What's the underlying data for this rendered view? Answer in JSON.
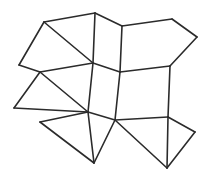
{
  "figure": {
    "type": "line-diagram",
    "background_color": "#ffffff",
    "line_color": "#2b2b2b",
    "line_width": 1.6,
    "canvas": {
      "width": 209,
      "height": 176
    }
  },
  "geometry": {
    "vertices": [
      {
        "id": "v0",
        "name": "top-left-apex",
        "x": 44,
        "y": 22
      },
      {
        "id": "v1",
        "name": "top-center-apex",
        "x": 95,
        "y": 13
      },
      {
        "id": "v2",
        "name": "top-upper-junction",
        "x": 122,
        "y": 26
      },
      {
        "id": "v3",
        "name": "top-right-apex",
        "x": 172,
        "y": 19
      },
      {
        "id": "v4",
        "name": "right-upper-corner",
        "x": 197,
        "y": 37
      },
      {
        "id": "v5",
        "name": "left-upper-corner",
        "x": 19,
        "y": 65
      },
      {
        "id": "v6",
        "name": "mid-left-junction",
        "x": 40,
        "y": 72
      },
      {
        "id": "v7",
        "name": "center-upper-junction",
        "x": 93,
        "y": 63
      },
      {
        "id": "v8",
        "name": "center-right-junction",
        "x": 120,
        "y": 72
      },
      {
        "id": "v9",
        "name": "right-mid-junction",
        "x": 170,
        "y": 66
      },
      {
        "id": "v10",
        "name": "left-mid-corner",
        "x": 14,
        "y": 108
      },
      {
        "id": "v11",
        "name": "center-lower-junction",
        "x": 88,
        "y": 112
      },
      {
        "id": "v12",
        "name": "lower-center-right-node",
        "x": 115,
        "y": 120
      },
      {
        "id": "v13",
        "name": "right-lower-junction",
        "x": 168,
        "y": 117
      },
      {
        "id": "v14",
        "name": "right-lower-corner",
        "x": 195,
        "y": 132
      },
      {
        "id": "v15",
        "name": "bottom-left-node",
        "x": 40,
        "y": 122
      },
      {
        "id": "v16",
        "name": "bottom-center-apex",
        "x": 94,
        "y": 163
      },
      {
        "id": "v17",
        "name": "bottom-right-apex",
        "x": 167,
        "y": 168
      }
    ],
    "edges": [
      {
        "name": "edge-top-left-to-top-center",
        "from": "v0",
        "to": "v1"
      },
      {
        "name": "edge-top-center-to-upper-junction",
        "from": "v1",
        "to": "v2"
      },
      {
        "name": "edge-upper-junction-to-top-right",
        "from": "v2",
        "to": "v3"
      },
      {
        "name": "edge-top-right-to-right-upper",
        "from": "v3",
        "to": "v4"
      },
      {
        "name": "edge-right-upper-to-right-mid",
        "from": "v4",
        "to": "v9"
      },
      {
        "name": "edge-top-left-to-left-upper",
        "from": "v0",
        "to": "v5"
      },
      {
        "name": "edge-left-upper-to-mid-left",
        "from": "v5",
        "to": "v6"
      },
      {
        "name": "edge-top-left-to-center-upper",
        "from": "v0",
        "to": "v7"
      },
      {
        "name": "edge-top-center-to-center-upper",
        "from": "v1",
        "to": "v7"
      },
      {
        "name": "edge-upper-junction-to-center-right",
        "from": "v2",
        "to": "v8"
      },
      {
        "name": "edge-mid-left-to-center-upper",
        "from": "v6",
        "to": "v7"
      },
      {
        "name": "edge-center-upper-to-center-right",
        "from": "v7",
        "to": "v8"
      },
      {
        "name": "edge-center-right-to-right-mid",
        "from": "v8",
        "to": "v9"
      },
      {
        "name": "edge-mid-left-to-left-mid",
        "from": "v6",
        "to": "v10"
      },
      {
        "name": "edge-mid-left-to-center-lower",
        "from": "v6",
        "to": "v11"
      },
      {
        "name": "edge-center-upper-to-center-lower",
        "from": "v7",
        "to": "v11"
      },
      {
        "name": "edge-center-right-to-lower-center",
        "from": "v8",
        "to": "v12"
      },
      {
        "name": "edge-right-mid-to-right-lower",
        "from": "v9",
        "to": "v13"
      },
      {
        "name": "edge-left-mid-to-center-lower",
        "from": "v10",
        "to": "v11"
      },
      {
        "name": "edge-center-lower-to-lower-center",
        "from": "v11",
        "to": "v12"
      },
      {
        "name": "edge-lower-center-to-right-lower",
        "from": "v12",
        "to": "v13"
      },
      {
        "name": "edge-right-lower-to-right-corner",
        "from": "v13",
        "to": "v14"
      },
      {
        "name": "edge-center-lower-to-bottom-left",
        "from": "v11",
        "to": "v15"
      },
      {
        "name": "edge-bottom-left-to-bottom-center",
        "from": "v15",
        "to": "v16"
      },
      {
        "name": "edge-center-lower-to-bottom-center",
        "from": "v11",
        "to": "v16"
      },
      {
        "name": "edge-lower-center-to-bottom-center",
        "from": "v12",
        "to": "v16"
      },
      {
        "name": "edge-right-lower-to-bottom-right",
        "from": "v13",
        "to": "v17"
      },
      {
        "name": "edge-lower-center-to-bottom-right",
        "from": "v12",
        "to": "v17"
      },
      {
        "name": "edge-bottom-right-to-right-corner",
        "from": "v17",
        "to": "v14"
      }
    ],
    "faces": [
      {
        "name": "face-upper-left",
        "vertices": [
          "v0",
          "v7",
          "v6",
          "v5"
        ]
      },
      {
        "name": "face-upper-center",
        "vertices": [
          "v0",
          "v1",
          "v7"
        ]
      },
      {
        "name": "face-upper-right-inner",
        "vertices": [
          "v1",
          "v2",
          "v8",
          "v7"
        ]
      },
      {
        "name": "face-upper-right",
        "vertices": [
          "v2",
          "v3",
          "v4",
          "v9",
          "v8"
        ]
      },
      {
        "name": "face-mid-left",
        "vertices": [
          "v6",
          "v11",
          "v10"
        ]
      },
      {
        "name": "face-mid-center",
        "vertices": [
          "v7",
          "v8",
          "v12",
          "v11"
        ]
      },
      {
        "name": "face-mid-right",
        "vertices": [
          "v8",
          "v9",
          "v13",
          "v12"
        ]
      },
      {
        "name": "face-lower-left",
        "vertices": [
          "v15",
          "v11",
          "v16"
        ]
      },
      {
        "name": "face-lower-center",
        "vertices": [
          "v11",
          "v12",
          "v16"
        ]
      },
      {
        "name": "face-lower-right",
        "vertices": [
          "v12",
          "v13",
          "v14",
          "v17"
        ]
      }
    ],
    "counts": {
      "vertex_count": 18,
      "edge_count": 29
    }
  }
}
